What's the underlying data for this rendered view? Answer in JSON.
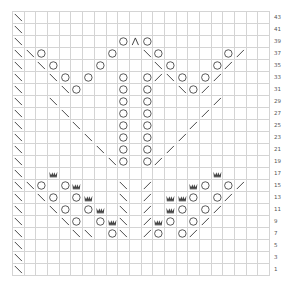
{
  "chart": {
    "columns": 22,
    "rows_displayed": 22,
    "row_numbers": [
      43,
      41,
      39,
      37,
      35,
      33,
      31,
      29,
      27,
      25,
      23,
      21,
      19,
      17,
      15,
      13,
      11,
      9,
      7,
      5,
      3,
      1
    ],
    "legend_symbols": {
      "\\": "k2tog / left-leaning decrease",
      "/": "ssk / right-leaning decrease",
      "O": "yarn over",
      "^": "centered double decrease",
      "W": "bobble / nupp (crown)"
    },
    "grid_color": "#d4d4d4",
    "symbol_color": "#333333",
    "crown_color": "#444444",
    "stitches": {
      "43": {
        "0": "\\"
      },
      "41": {
        "0": "\\"
      },
      "39": {
        "0": "\\",
        "9": "O",
        "10": "^",
        "11": "O"
      },
      "37": {
        "0": "\\",
        "1": "\\",
        "2": "O",
        "8": "O",
        "11": "\\",
        "12": "O",
        "18": "O",
        "19": "/"
      },
      "35": {
        "0": "\\",
        "2": "\\",
        "3": "O",
        "7": "O",
        "12": "\\",
        "13": "O",
        "17": "O",
        "18": "/"
      },
      "33": {
        "0": "\\",
        "3": "\\",
        "4": "O",
        "6": "O",
        "9": "O",
        "11": "O",
        "12": "/",
        "13": "\\",
        "14": "O",
        "16": "O",
        "17": "/"
      },
      "31": {
        "0": "\\",
        "4": "\\",
        "5": "O",
        "9": "O",
        "11": "O",
        "14": "\\",
        "15": "O",
        "16": "/"
      },
      "29": {
        "0": "\\",
        "3": "\\",
        "9": "O",
        "11": "O",
        "17": "/"
      },
      "27": {
        "0": "\\",
        "4": "\\",
        "9": "O",
        "11": "O",
        "16": "/"
      },
      "25": {
        "0": "\\",
        "5": "\\",
        "9": "O",
        "11": "O",
        "15": "/"
      },
      "23": {
        "0": "\\",
        "6": "\\",
        "9": "O",
        "11": "O",
        "14": "/"
      },
      "21": {
        "0": "\\",
        "7": "\\",
        "9": "O",
        "11": "O",
        "13": "/"
      },
      "19": {
        "0": "\\",
        "8": "\\",
        "9": "O",
        "11": "O",
        "12": "/"
      },
      "17": {
        "0": "\\",
        "3": "W",
        "17": "W"
      },
      "15": {
        "0": "\\",
        "1": "\\",
        "2": "O",
        "4": "O",
        "5": "W",
        "9": "\\",
        "11": "/",
        "15": "W",
        "16": "O",
        "18": "O",
        "19": "/"
      },
      "13": {
        "0": "\\",
        "2": "\\",
        "3": "O",
        "5": "O",
        "6": "W",
        "9": "\\",
        "11": "/",
        "13": "W",
        "14": "W",
        "15": "O",
        "17": "O",
        "18": "/"
      },
      "11": {
        "0": "\\",
        "3": "\\",
        "4": "O",
        "6": "O",
        "7": "W",
        "9": "\\",
        "11": "/",
        "13": "W",
        "14": "O",
        "16": "O",
        "17": "/"
      },
      "9": {
        "0": "\\",
        "4": "\\",
        "5": "O",
        "7": "O",
        "8": "W",
        "9": "\\",
        "11": "/",
        "12": "W",
        "13": "O",
        "15": "O",
        "16": "/"
      },
      "7": {
        "0": "\\",
        "5": "\\",
        "6": "\\",
        "8": "O",
        "9": "\\",
        "11": "/",
        "12": "O",
        "14": "O",
        "15": "/"
      },
      "5": {
        "0": "\\"
      },
      "3": {
        "0": "\\"
      },
      "1": {
        "0": "\\"
      }
    }
  }
}
